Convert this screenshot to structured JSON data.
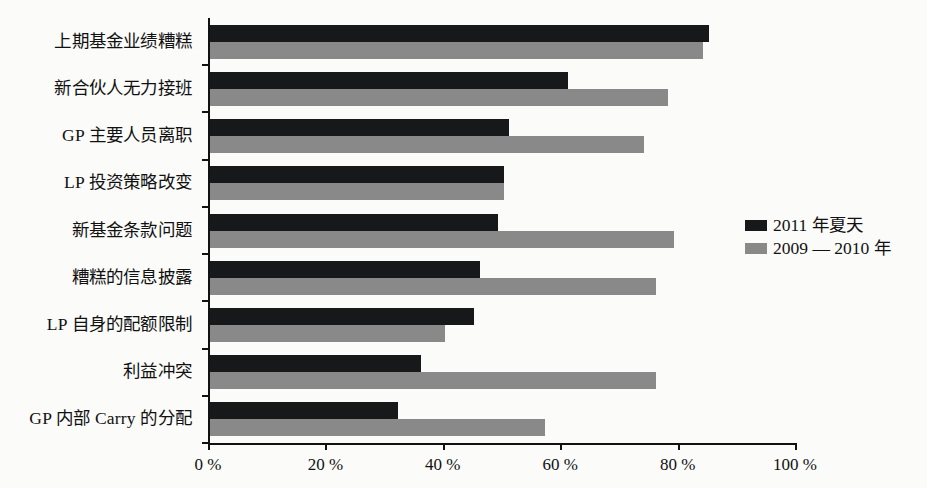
{
  "chart_data": {
    "type": "bar",
    "orientation": "horizontal",
    "title": "",
    "xlabel": "",
    "ylabel": "",
    "xlim": [
      0,
      100
    ],
    "grid": false,
    "legend_position": "right",
    "xticks": [
      "0 %",
      "20 %",
      "40 %",
      "60 %",
      "80 %",
      "100 %"
    ],
    "xtick_values": [
      0,
      20,
      40,
      60,
      80,
      100
    ],
    "categories": [
      "上期基金业绩糟糕",
      "新合伙人无力接班",
      "GP 主要人员离职",
      "LP 投资策略改变",
      "新基金条款问题",
      "糟糕的信息披露",
      "LP 自身的配额限制",
      "利益冲突",
      "GP 内部 Carry 的分配"
    ],
    "series": [
      {
        "name": "2011 年夏天",
        "color": "#17181a",
        "values": [
          85,
          61,
          51,
          50,
          49,
          46,
          45,
          36,
          32
        ]
      },
      {
        "name": "2009 — 2010 年",
        "color": "#898989",
        "values": [
          84,
          78,
          74,
          50,
          79,
          76,
          40,
          76,
          57
        ]
      }
    ]
  },
  "legend": {
    "items": [
      {
        "label": "2011 年夏天",
        "swatch": "series-a"
      },
      {
        "label": "2009 — 2010 年",
        "swatch": "series-b"
      }
    ]
  }
}
